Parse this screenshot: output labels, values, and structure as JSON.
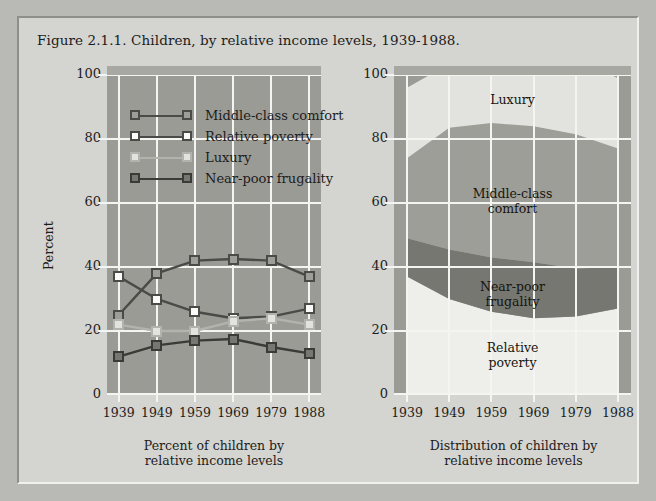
{
  "figure": {
    "title": "Figure 2.1.1. Children, by relative income levels, 1939-1988.",
    "background": "#d4d4d0",
    "plot_background": "#9b9b96",
    "grid_color": "#f4f4f2"
  },
  "legend": {
    "items": [
      {
        "label": "Middle-class comfort",
        "fill": "#9e9e99",
        "marker_border": "#4a4a46",
        "line": "#4a4a46"
      },
      {
        "label": "Relative poverty",
        "fill": "#fbfbf9",
        "marker_border": "#4a4a46",
        "line": "#4a4a46"
      },
      {
        "label": "Luxury",
        "fill": "#e2e2de",
        "marker_border": "#b3b3ae",
        "line": "#b3b3ae"
      },
      {
        "label": "Near-poor frugality",
        "fill": "#777772",
        "marker_border": "#3a3a36",
        "line": "#3a3a36"
      }
    ]
  },
  "axes": {
    "ylabel": "Percent",
    "yticks": [
      "0",
      "20",
      "40",
      "60",
      "80",
      "100"
    ],
    "ytick_values": [
      0,
      20,
      40,
      60,
      80,
      100
    ],
    "ylim": [
      0,
      100
    ],
    "xticks": [
      "1939",
      "1949",
      "1959",
      "1969",
      "1979",
      "1988"
    ]
  },
  "panels": {
    "left_caption": "Percent of children by\nrelative income levels",
    "left_caption_line1": "Percent of children by",
    "left_caption_line2": "relative income levels",
    "right_caption": "Distribution of children by\nrelative income levels",
    "right_caption_line1": "Distribution of children by",
    "right_caption_line2": "relative income levels"
  },
  "area_labels": [
    {
      "text": "Luxury",
      "x_frac": 0.5,
      "y_pct": 92
    },
    {
      "text_line1": "Middle-class",
      "text_line2": "comfort",
      "x_frac": 0.5,
      "y_pct": 60
    },
    {
      "text_line1": "Near-poor",
      "text_line2": "frugality",
      "x_frac": 0.5,
      "y_pct": 31
    },
    {
      "text_line1": "Relative",
      "text_line2": "poverty",
      "x_frac": 0.5,
      "y_pct": 12
    }
  ],
  "chart_data": [
    {
      "type": "line",
      "title": "Percent of children by relative income levels",
      "xlabel": "",
      "ylabel": "Percent",
      "ylim": [
        0,
        100
      ],
      "grid": true,
      "legend_position": "upper-left-inside",
      "categories": [
        "1939",
        "1949",
        "1959",
        "1969",
        "1979",
        "1988"
      ],
      "series": [
        {
          "name": "Middle-class comfort",
          "values": [
            25,
            38,
            42,
            42.5,
            42,
            37
          ],
          "fill": "#9e9e99",
          "stroke": "#4a4a46"
        },
        {
          "name": "Relative poverty",
          "values": [
            37,
            30,
            26,
            24,
            24.5,
            27
          ],
          "fill": "#fbfbf9",
          "stroke": "#4a4a46"
        },
        {
          "name": "Luxury",
          "values": [
            22,
            20,
            20,
            23,
            24,
            22
          ],
          "fill": "#e2e2de",
          "stroke": "#b3b3ae"
        },
        {
          "name": "Near-poor frugality",
          "values": [
            12,
            15.5,
            17,
            17.5,
            15,
            13
          ],
          "fill": "#777772",
          "stroke": "#3a3a36"
        }
      ]
    },
    {
      "type": "area",
      "stacked": true,
      "title": "Distribution of children by relative income levels",
      "xlabel": "",
      "ylabel": "Percent",
      "ylim": [
        0,
        100
      ],
      "grid": true,
      "categories": [
        "1939",
        "1949",
        "1959",
        "1969",
        "1979",
        "1988"
      ],
      "series": [
        {
          "name": "Relative poverty",
          "values": [
            37,
            30,
            26,
            24,
            24.5,
            27
          ],
          "fill": "#eeeeea"
        },
        {
          "name": "Near-poor frugality",
          "values": [
            12,
            15.5,
            17,
            17.5,
            15,
            13
          ],
          "fill": "#777772"
        },
        {
          "name": "Middle-class comfort",
          "values": [
            25,
            38,
            42,
            42.5,
            42,
            37
          ],
          "fill": "#9e9e99"
        },
        {
          "name": "Luxury",
          "values": [
            22,
            20,
            20,
            23,
            24,
            22
          ],
          "fill": "#e2e2de"
        }
      ]
    }
  ]
}
